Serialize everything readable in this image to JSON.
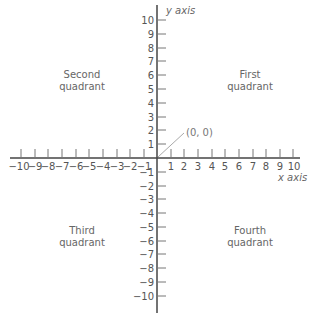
{
  "diagram": {
    "type": "cartesian-coordinate-plane",
    "x_axis": {
      "label": "x axis",
      "min": -10,
      "max": 10
    },
    "y_axis": {
      "label": "y axis",
      "min": -10,
      "max": 10
    },
    "origin": {
      "label": "(0, 0)"
    },
    "quadrants": {
      "first": {
        "line1": "First",
        "line2": "quadrant"
      },
      "second": {
        "line1": "Second",
        "line2": "quadrant"
      },
      "third": {
        "line1": "Third",
        "line2": "quadrant"
      },
      "fourth": {
        "line1": "Fourth",
        "line2": "quadrant"
      }
    },
    "x_ticks_negative": [
      "−10",
      "−9",
      "−8",
      "−7",
      "−6",
      "−5",
      "−4",
      "−3",
      "−2",
      "−1"
    ],
    "x_ticks_positive": [
      "1",
      "2",
      "3",
      "4",
      "5",
      "6",
      "7",
      "8",
      "9",
      "10"
    ],
    "y_ticks_positive": [
      "1",
      "2",
      "3",
      "4",
      "5",
      "6",
      "7",
      "8",
      "9",
      "10"
    ],
    "y_ticks_negative": [
      "−1",
      "−2",
      "−3",
      "−4",
      "−5",
      "−6",
      "−7",
      "−8",
      "−9",
      "−10"
    ],
    "colors": {
      "axis": "#444444",
      "tick": "#777777",
      "text": "#555555",
      "pointer": "#aaaaaa"
    }
  }
}
